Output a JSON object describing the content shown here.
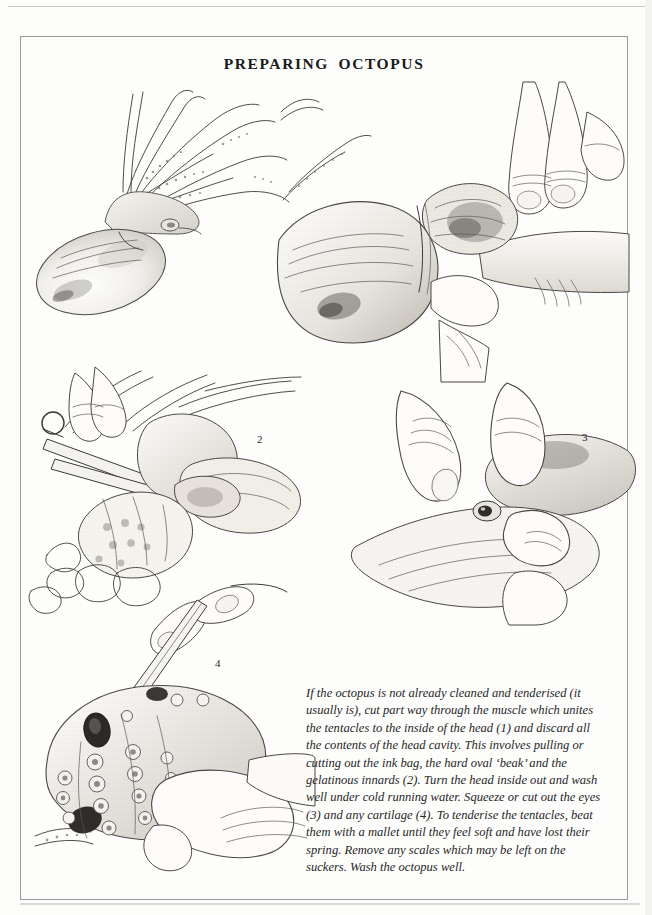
{
  "page": {
    "title": "PREPARING OCTOPUS",
    "background_color": "#fdfdfc",
    "ink_color": "#3a3a38",
    "frame_color": "#9a9a9a"
  },
  "figures": [
    {
      "id": "figure-1",
      "number": "1",
      "subject": "whole raw octopus beside hands pulling tentacles away from the head to expose the head cavity",
      "caption_reference": "(1)"
    },
    {
      "id": "figure-2",
      "number": "2",
      "subject": "scissors cutting the muscle uniting the tentacles, head inverted showing the ink bag, beak and gelatinous innards",
      "caption_reference": "(2)"
    },
    {
      "id": "figure-3",
      "number": "3",
      "subject": "two hands squeezing an eye out of the octopus head",
      "caption_reference": "(3)"
    },
    {
      "id": "figure-4",
      "number": "4",
      "subject": "knife point cutting out the cartilage from between the suckered tentacles",
      "caption_reference": "(4)"
    }
  ],
  "caption": {
    "text": "If the octopus is not already cleaned and tenderised (it usually is), cut part way through the muscle which unites the tentacles to the inside of the head (1) and discard all the contents of the head cavity. This involves pulling or cutting out the ink bag, the hard oval ‘beak’ and the gelatinous innards (2). Turn the head inside out and wash well under cold running water. Squeeze or cut out the eyes (3) and any cartilage (4). To tenderise the tentacles, beat them with a mallet until they feel soft and have lost their spring. Remove any scales which may be left on the suckers. Wash the octopus well."
  }
}
